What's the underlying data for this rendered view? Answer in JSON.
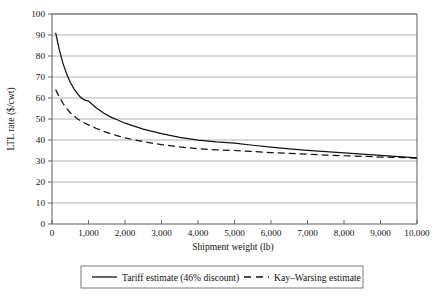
{
  "chart_data": {
    "type": "line",
    "title": "",
    "xlabel": "Shipment weight (lb)",
    "ylabel": "LTL rate ($/cwt)",
    "xlim": [
      0,
      10000
    ],
    "ylim": [
      0,
      100
    ],
    "grid": true,
    "legend_position": "bottom",
    "x_ticks": [
      0,
      1000,
      2000,
      3000,
      4000,
      5000,
      6000,
      7000,
      8000,
      9000,
      10000
    ],
    "x_tick_labels": [
      "0",
      "1,000",
      "2,000",
      "3,000",
      "4,000",
      "5,000",
      "6,000",
      "7,000",
      "8,000",
      "9,000",
      "10,000"
    ],
    "y_ticks": [
      0,
      10,
      20,
      30,
      40,
      50,
      60,
      70,
      80,
      90,
      100
    ],
    "y_tick_labels": [
      "0",
      "10",
      "20",
      "30",
      "40",
      "50",
      "60",
      "70",
      "80",
      "90",
      "100"
    ],
    "x": [
      100,
      200,
      300,
      400,
      500,
      600,
      700,
      800,
      900,
      1000,
      1200,
      1400,
      1600,
      1800,
      2000,
      2500,
      3000,
      3500,
      4000,
      4500,
      5000,
      5500,
      6000,
      6500,
      7000,
      7500,
      8000,
      8500,
      9000,
      9500,
      10000
    ],
    "series": [
      {
        "name": "Tariff estimate (46% discount)",
        "style": "solid",
        "values": [
          91.0,
          83.0,
          76.5,
          71.5,
          67.5,
          64.5,
          62.0,
          60.0,
          59.0,
          58.5,
          55.5,
          53.0,
          51.0,
          49.5,
          48.0,
          45.2,
          43.0,
          41.3,
          39.9,
          39.1,
          38.5,
          37.5,
          36.6,
          35.8,
          35.1,
          34.5,
          33.9,
          33.3,
          32.7,
          32.1,
          31.5
        ],
        "start_value": 91.0,
        "end_value": 31.5
      },
      {
        "name": "Kay–Warsing estimate",
        "style": "dashed",
        "values": [
          64.0,
          60.5,
          57.5,
          55.0,
          53.0,
          51.5,
          50.0,
          49.0,
          48.0,
          47.2,
          45.6,
          44.2,
          43.0,
          42.0,
          41.0,
          39.2,
          37.8,
          36.7,
          35.8,
          35.3,
          35.0,
          34.5,
          34.0,
          33.6,
          33.2,
          32.8,
          32.5,
          32.2,
          31.9,
          31.7,
          31.4
        ],
        "start_value": 64.0,
        "end_value": 31.4
      }
    ]
  },
  "legend": {
    "entries": [
      {
        "label": "Tariff estimate (46% discount)",
        "style": "solid"
      },
      {
        "label": "Kay–Warsing estimate",
        "style": "dashed"
      }
    ]
  },
  "colors": {
    "series_line": "#111111",
    "grid": "#8f8f8f",
    "frame": "#5a5a5a",
    "background": "#ffffff",
    "text": "#111111"
  }
}
